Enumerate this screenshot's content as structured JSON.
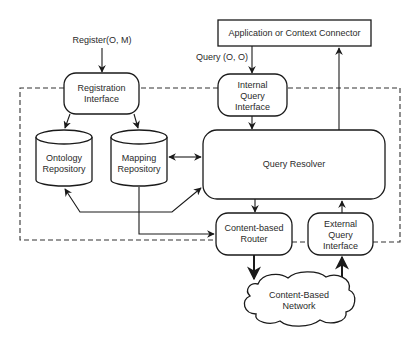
{
  "diagram": {
    "boundary": {
      "name": "system-boundary",
      "style": "dashed"
    },
    "nodes": {
      "register_input": {
        "label": "Register(O, M)"
      },
      "registration_interface": {
        "lines": [
          "Registration",
          "Interface"
        ]
      },
      "ontology_repository": {
        "lines": [
          "Ontology",
          "Repository"
        ],
        "shape": "cylinder"
      },
      "mapping_repository": {
        "lines": [
          "Mapping",
          "Repository"
        ],
        "shape": "cylinder"
      },
      "app_connector": {
        "label": "Application or Context Connector"
      },
      "query_input": {
        "label": "Query (O, O)"
      },
      "internal_query_interface": {
        "lines": [
          "Internal",
          "Query",
          "Interface"
        ]
      },
      "query_resolver": {
        "label": "Query Resolver"
      },
      "content_router": {
        "lines": [
          "Content-based",
          "Router"
        ]
      },
      "external_query_interface": {
        "lines": [
          "External",
          "Query",
          "Interface"
        ]
      },
      "network": {
        "lines": [
          "Content-Based",
          "Network"
        ],
        "shape": "cloud"
      }
    },
    "edges": [
      {
        "from": "register_input",
        "to": "registration_interface"
      },
      {
        "from": "registration_interface",
        "to": "ontology_repository"
      },
      {
        "from": "registration_interface",
        "to": "mapping_repository"
      },
      {
        "from": "mapping_repository",
        "to": "query_resolver",
        "bidirectional": true
      },
      {
        "from": "query_resolver",
        "to": "ontology_repository",
        "bidirectional": true
      },
      {
        "from": "mapping_repository",
        "to": "content_router"
      },
      {
        "from": "app_connector",
        "to": "internal_query_interface",
        "label": "Query (O, O)"
      },
      {
        "from": "internal_query_interface",
        "to": "query_resolver"
      },
      {
        "from": "query_resolver",
        "to": "app_connector"
      },
      {
        "from": "query_resolver",
        "to": "content_router"
      },
      {
        "from": "external_query_interface",
        "to": "query_resolver"
      },
      {
        "from": "content_router",
        "to": "network"
      },
      {
        "from": "network",
        "to": "external_query_interface"
      }
    ]
  }
}
